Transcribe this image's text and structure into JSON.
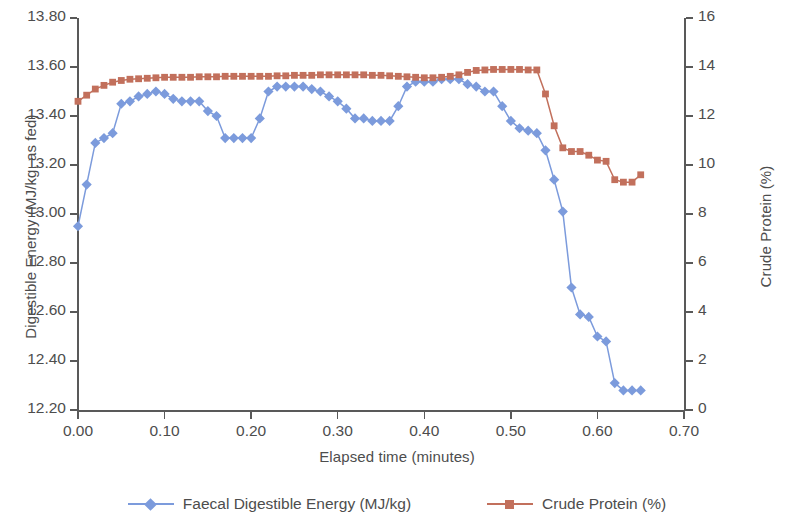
{
  "chart_data": {
    "type": "line",
    "title": "",
    "xlabel": "Elapsed time (minutes)",
    "ylabel": "Digestible Energy (MJ/kg, as fed)",
    "y2label": "Crude Protein (%)",
    "xlim": [
      0.0,
      0.7
    ],
    "ylim": [
      12.2,
      13.8
    ],
    "y2lim": [
      0,
      16
    ],
    "xticks": [
      "0.00",
      "0.10",
      "0.20",
      "0.30",
      "0.40",
      "0.50",
      "0.60",
      "0.70"
    ],
    "xtick_values": [
      0.0,
      0.1,
      0.2,
      0.3,
      0.4,
      0.5,
      0.6,
      0.7
    ],
    "yticks": [
      "12.20",
      "12.40",
      "12.60",
      "12.80",
      "13.00",
      "13.20",
      "13.40",
      "13.60",
      "13.80"
    ],
    "ytick_values": [
      12.2,
      12.4,
      12.6,
      12.8,
      13.0,
      13.2,
      13.4,
      13.6,
      13.8
    ],
    "y2ticks": [
      "0",
      "2",
      "4",
      "6",
      "8",
      "10",
      "12",
      "14",
      "16"
    ],
    "y2tick_values": [
      0,
      2,
      4,
      6,
      8,
      10,
      12,
      14,
      16
    ],
    "grid": false,
    "legend_position": "bottom",
    "series": [
      {
        "name": "Faecal Digestible Energy (MJ/kg)",
        "axis": "left",
        "color": "#7C9BDC",
        "marker": "diamond",
        "x": [
          0.0,
          0.01,
          0.02,
          0.03,
          0.04,
          0.05,
          0.06,
          0.07,
          0.08,
          0.09,
          0.1,
          0.11,
          0.12,
          0.13,
          0.14,
          0.15,
          0.16,
          0.17,
          0.18,
          0.19,
          0.2,
          0.21,
          0.22,
          0.23,
          0.24,
          0.25,
          0.26,
          0.27,
          0.28,
          0.29,
          0.3,
          0.31,
          0.32,
          0.33,
          0.34,
          0.35,
          0.36,
          0.37,
          0.38,
          0.39,
          0.4,
          0.41,
          0.42,
          0.43,
          0.44,
          0.45,
          0.46,
          0.47,
          0.48,
          0.49,
          0.5,
          0.51,
          0.52,
          0.53,
          0.54,
          0.55,
          0.56,
          0.57,
          0.58,
          0.59,
          0.6,
          0.61,
          0.62,
          0.63,
          0.64,
          0.65
        ],
        "y": [
          12.95,
          13.12,
          13.29,
          13.31,
          13.33,
          13.45,
          13.46,
          13.48,
          13.49,
          13.5,
          13.49,
          13.47,
          13.46,
          13.46,
          13.46,
          13.42,
          13.4,
          13.31,
          13.31,
          13.31,
          13.31,
          13.39,
          13.5,
          13.52,
          13.52,
          13.52,
          13.52,
          13.51,
          13.5,
          13.48,
          13.46,
          13.43,
          13.39,
          13.39,
          13.38,
          13.38,
          13.38,
          13.44,
          13.52,
          13.54,
          13.54,
          13.54,
          13.55,
          13.55,
          13.55,
          13.53,
          13.52,
          13.5,
          13.5,
          13.44,
          13.38,
          13.35,
          13.34,
          13.33,
          13.26,
          13.14,
          13.01,
          12.7,
          12.59,
          12.58,
          12.5,
          12.48,
          12.31,
          12.28,
          12.28,
          12.28
        ]
      },
      {
        "name": "Crude Protein (%)",
        "axis": "right",
        "color": "#C2705C",
        "marker": "square",
        "x": [
          0.0,
          0.01,
          0.02,
          0.03,
          0.04,
          0.05,
          0.06,
          0.07,
          0.08,
          0.09,
          0.1,
          0.11,
          0.12,
          0.13,
          0.14,
          0.15,
          0.16,
          0.17,
          0.18,
          0.19,
          0.2,
          0.21,
          0.22,
          0.23,
          0.24,
          0.25,
          0.26,
          0.27,
          0.28,
          0.29,
          0.3,
          0.31,
          0.32,
          0.33,
          0.34,
          0.35,
          0.36,
          0.37,
          0.38,
          0.39,
          0.4,
          0.41,
          0.42,
          0.43,
          0.44,
          0.45,
          0.46,
          0.47,
          0.48,
          0.49,
          0.5,
          0.51,
          0.52,
          0.53,
          0.54,
          0.55,
          0.56,
          0.57,
          0.58,
          0.59,
          0.6,
          0.61,
          0.62,
          0.63,
          0.64,
          0.65
        ],
        "y": [
          12.6,
          12.85,
          13.1,
          13.25,
          13.38,
          13.45,
          13.5,
          13.52,
          13.54,
          13.56,
          13.58,
          13.58,
          13.58,
          13.58,
          13.6,
          13.6,
          13.6,
          13.62,
          13.62,
          13.62,
          13.62,
          13.62,
          13.62,
          13.64,
          13.64,
          13.66,
          13.66,
          13.66,
          13.68,
          13.68,
          13.68,
          13.68,
          13.68,
          13.68,
          13.66,
          13.66,
          13.64,
          13.62,
          13.6,
          13.58,
          13.56,
          13.56,
          13.58,
          13.62,
          13.68,
          13.78,
          13.86,
          13.88,
          13.9,
          13.9,
          13.9,
          13.9,
          13.88,
          13.88,
          12.9,
          11.6,
          10.7,
          10.55,
          10.55,
          10.4,
          10.2,
          10.15,
          9.4,
          9.3,
          9.3,
          9.6
        ]
      }
    ]
  },
  "axes": {
    "left_title": "Digestible Energy (MJ/kg, as fed)",
    "right_title": "Crude Protein (%)",
    "x_title": "Elapsed time (minutes)"
  },
  "legend": {
    "items": [
      {
        "label": "Faecal Digestible Energy (MJ/kg)",
        "color": "#7C9BDC",
        "marker": "diamond"
      },
      {
        "label": "Crude Protein (%)",
        "color": "#C2705C",
        "marker": "square"
      }
    ]
  },
  "colors": {
    "series_blue": "#7C9BDC",
    "series_red": "#C2705C",
    "axis": "#595959",
    "text": "#4d4d4d",
    "background": "#ffffff"
  }
}
